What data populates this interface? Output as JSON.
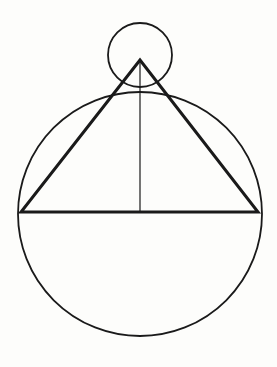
{
  "figure": {
    "background_color": "#fdfdfb",
    "stroke_color": "#1a1a1a",
    "canvas": {
      "width": 277,
      "height": 367
    },
    "shapes": {
      "large_circle": {
        "name": "large-circle",
        "cx": 140,
        "cy": 214,
        "r": 122,
        "stroke_width": 1.8,
        "fill": "none"
      },
      "small_circle": {
        "name": "small-circle",
        "cx": 140,
        "cy": 55,
        "r": 32,
        "stroke_width": 1.8,
        "fill": "none"
      },
      "triangle": {
        "name": "isoceles-triangle",
        "apex_x": 140,
        "apex_y": 60,
        "left_x": 21,
        "left_y": 212,
        "right_x": 258,
        "right_y": 212,
        "points": "140,60 21,212 258,212",
        "stroke_width": 3,
        "fill": "none"
      },
      "altitude_line": {
        "name": "altitude-line",
        "x1": 140,
        "y1": 60,
        "x2": 140,
        "y2": 212,
        "stroke_width": 1.2
      }
    }
  }
}
